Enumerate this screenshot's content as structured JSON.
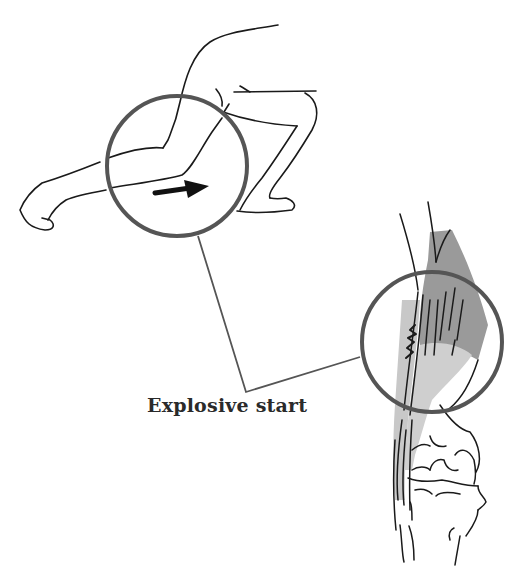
{
  "figure": {
    "label": "Explosive start",
    "callout_circle_color": "#555555",
    "line_color": "#1a1a1a",
    "muscle_dark_color": "#9a9a9a",
    "muscle_light_color": "#cfcfcf"
  },
  "panels": [
    {
      "name": "runner-start-pose",
      "description": "Sprinter in crouched start position with arrow indicating push-off direction",
      "icon": "right-arrow-icon"
    },
    {
      "name": "knee-anatomy-detail",
      "description": "Knee joint with quadriceps tendon showing strain/tear zone"
    }
  ]
}
